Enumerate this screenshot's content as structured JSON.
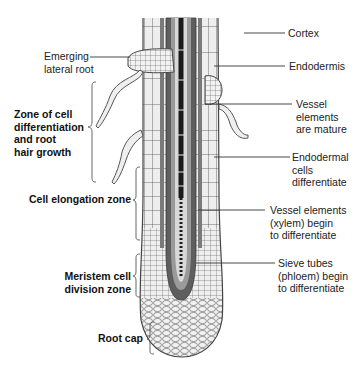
{
  "diagram": {
    "colors": {
      "background": "#ffffff",
      "cell_outline": "#4a4a4a",
      "cell_fill": "#ececec",
      "vascular_dark": "#5c5c5c",
      "vascular_mid": "#8a8a8a",
      "xylem_black": "#1c1c1c",
      "label_text": "#222222"
    },
    "left_labels": [
      {
        "id": "emerging-lateral-root",
        "lines": [
          "Emerging",
          "lateral root"
        ],
        "bold": false
      },
      {
        "id": "zone-differentiation",
        "lines": [
          "Zone of cell",
          "differentiation",
          "and root",
          "hair growth"
        ],
        "bold": true
      },
      {
        "id": "cell-elongation",
        "lines": [
          "Cell elongation zone"
        ],
        "bold": true
      },
      {
        "id": "meristem",
        "lines": [
          "Meristem cell",
          "division zone"
        ],
        "bold": true
      },
      {
        "id": "root-cap",
        "lines": [
          "Root cap"
        ],
        "bold": true
      }
    ],
    "right_labels": [
      {
        "id": "cortex",
        "lines": [
          "Cortex"
        ]
      },
      {
        "id": "endodermis",
        "lines": [
          "Endodermis"
        ]
      },
      {
        "id": "vessel-mature",
        "lines": [
          "Vessel",
          "elements",
          "are mature"
        ]
      },
      {
        "id": "endodermal-differentiate",
        "lines": [
          "Endodermal",
          "cells",
          "differentiate"
        ]
      },
      {
        "id": "xylem-begin",
        "lines": [
          "Vessel elements",
          "(xylem) begin",
          "to differentiate"
        ]
      },
      {
        "id": "phloem-begin",
        "lines": [
          "Sieve tubes",
          "(phloem) begin",
          "to differentiate"
        ]
      }
    ]
  }
}
